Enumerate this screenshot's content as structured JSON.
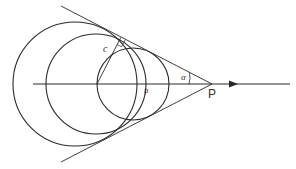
{
  "diagram": {
    "title": "",
    "labels": {
      "point_p": "P",
      "angle_alpha": "α",
      "chord_c": "c",
      "velocity_u": "u"
    },
    "colors": {
      "line": "#2a2a2a",
      "background": "#ffffff"
    },
    "circles": [
      {
        "name": "large-circle",
        "cx": 75,
        "cy": 84,
        "r": 62
      },
      {
        "name": "middle-circle",
        "cx": 96,
        "cy": 84,
        "r": 50
      },
      {
        "name": "small-circle",
        "cx": 133,
        "cy": 84,
        "r": 36
      }
    ],
    "apex": {
      "x": 212,
      "y": 84
    }
  }
}
